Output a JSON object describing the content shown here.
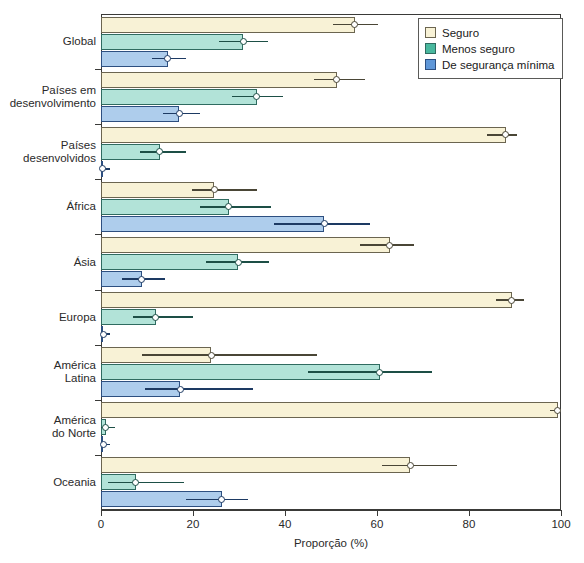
{
  "chart_data": {
    "type": "bar",
    "orientation": "horizontal",
    "title": "",
    "xlabel": "Proporção (%)",
    "ylabel": "",
    "xlim": [
      0,
      100
    ],
    "xticks": [
      0,
      20,
      40,
      60,
      80,
      100
    ],
    "grid": false,
    "legend_position": "top-right",
    "categories": [
      "Global",
      "Países em\ndesenvolvimento",
      "Países\ndesenvolvidos",
      "África",
      "Ásia",
      "Europa",
      "América\nLatina",
      "América\ndo Norte",
      "Oceania"
    ],
    "series": [
      {
        "name": "Seguro",
        "color": "#f8f2d6",
        "values": [
          55.2,
          51.3,
          88.0,
          24.6,
          62.8,
          89.3,
          24.0,
          99.3,
          67.2
        ],
        "ci_low": [
          50.4,
          46.4,
          84.0,
          19.8,
          56.4,
          85.8,
          9.0,
          97.5,
          61.0
        ],
        "ci_high": [
          60.2,
          57.5,
          90.5,
          34.0,
          68.0,
          92.0,
          47.0,
          100.0,
          77.5
        ]
      },
      {
        "name": "Menos seguro",
        "color": "#b2e3d8",
        "values": [
          30.9,
          33.9,
          12.8,
          27.8,
          29.8,
          11.9,
          60.6,
          1.0,
          7.6
        ],
        "ci_low": [
          25.7,
          28.5,
          8.5,
          21.5,
          22.8,
          7.0,
          45.0,
          0.0,
          1.5
        ],
        "ci_high": [
          36.3,
          39.5,
          18.5,
          37.0,
          36.5,
          20.0,
          72.0,
          3.0,
          18.0
        ]
      },
      {
        "name": "De segurança mínima",
        "color": "#aecdec",
        "values": [
          14.5,
          17.0,
          0.3,
          48.5,
          8.9,
          0.5,
          17.2,
          0.5,
          26.3
        ],
        "ci_low": [
          11.0,
          13.5,
          0.0,
          37.5,
          4.5,
          0.0,
          9.5,
          0.0,
          18.5
        ],
        "ci_high": [
          18.5,
          21.5,
          2.0,
          58.5,
          14.0,
          2.0,
          33.0,
          2.0,
          32.0
        ]
      }
    ]
  },
  "legend": {
    "items": [
      {
        "label": "Seguro",
        "swatch": "seguro"
      },
      {
        "label": "Menos seguro",
        "swatch": "menos"
      },
      {
        "label": "De segurança mínima",
        "swatch": "minima"
      }
    ]
  },
  "axis": {
    "x_title": "Proporção (%)",
    "x_tick_labels": [
      "0",
      "20",
      "40",
      "60",
      "80",
      "100"
    ]
  }
}
